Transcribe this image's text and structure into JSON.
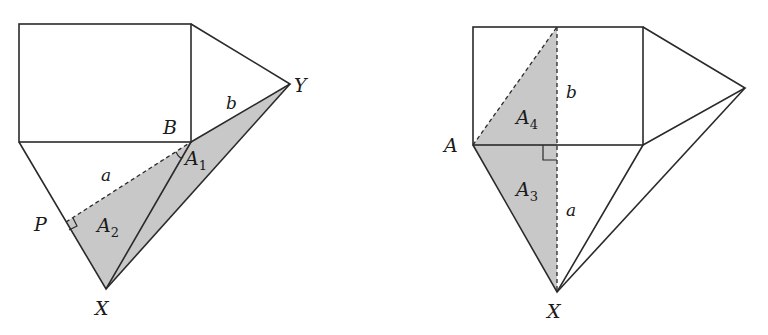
{
  "colors": {
    "stroke": "#2a2a2a",
    "shade": "#c8c8c8",
    "background": "#ffffff"
  },
  "left_figure": {
    "labels": {
      "B": "B",
      "Y": "Y",
      "X": "X",
      "P": "P",
      "a": "a",
      "b": "b",
      "A1_main": "A",
      "A1_sub": "1",
      "A2_main": "A",
      "A2_sub": "2"
    }
  },
  "right_figure": {
    "labels": {
      "A": "A",
      "X": "X",
      "a": "a",
      "b": "b",
      "A3_main": "A",
      "A3_sub": "3",
      "A4_main": "A",
      "A4_sub": "4"
    }
  }
}
